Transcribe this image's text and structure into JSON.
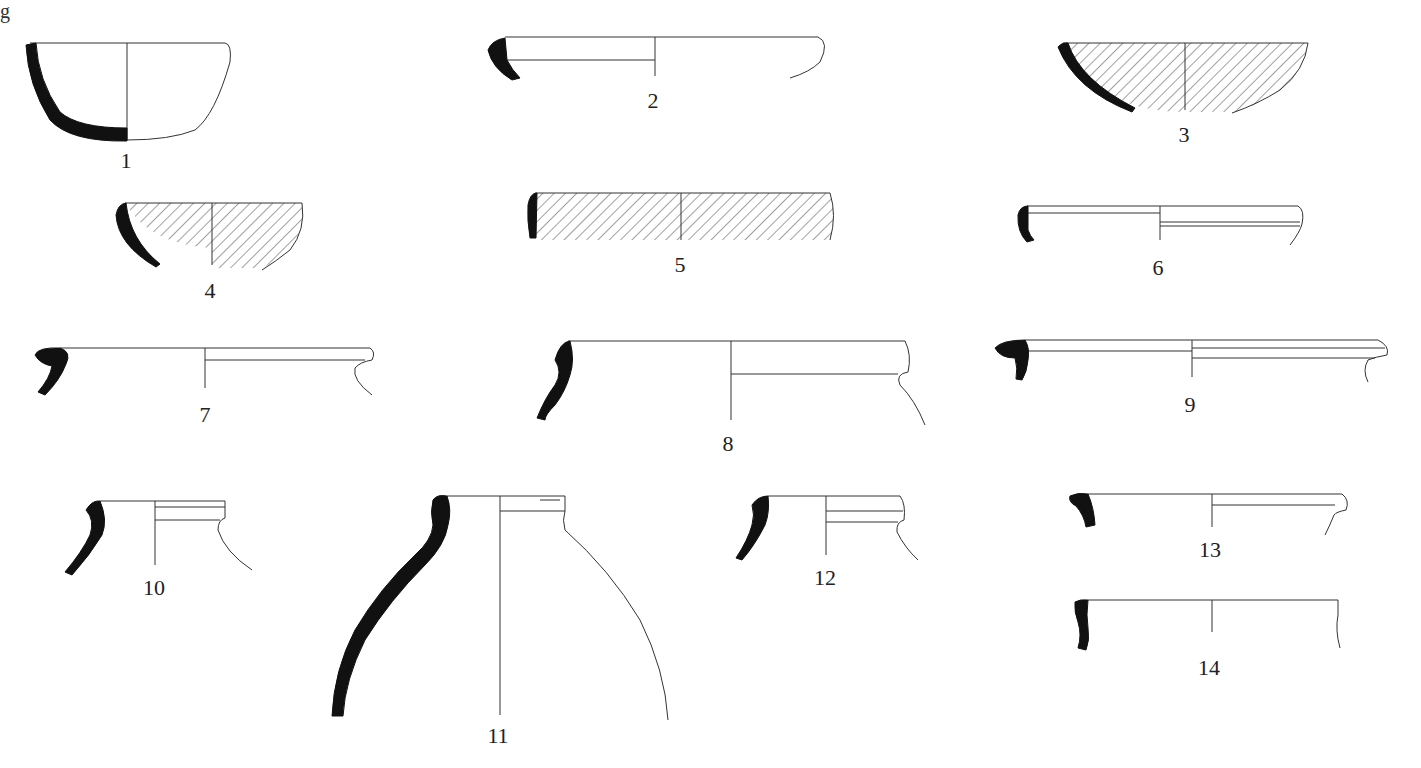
{
  "figure": {
    "type": "pottery-profiles",
    "corner_fragment": "g",
    "items": [
      {
        "label": "1"
      },
      {
        "label": "2"
      },
      {
        "label": "3"
      },
      {
        "label": "4"
      },
      {
        "label": "5"
      },
      {
        "label": "6"
      },
      {
        "label": "7"
      },
      {
        "label": "8"
      },
      {
        "label": "9"
      },
      {
        "label": "10"
      },
      {
        "label": "11"
      },
      {
        "label": "12"
      },
      {
        "label": "13"
      },
      {
        "label": "14"
      }
    ]
  }
}
